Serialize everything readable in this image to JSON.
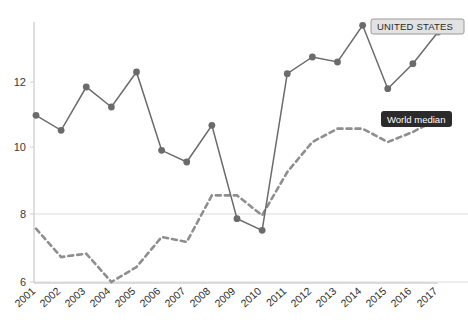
{
  "chart_data": {
    "type": "line",
    "title": "",
    "subtitle": "",
    "xlabel": "",
    "ylabel": "",
    "x": [
      2001,
      2002,
      2003,
      2004,
      2005,
      2006,
      2007,
      2008,
      2009,
      2010,
      2011,
      2012,
      2013,
      2014,
      2015,
      2016,
      2017
    ],
    "xticklabels": [
      "2001",
      "2002",
      "2003",
      "2004",
      "2005",
      "2006",
      "2007",
      "2008",
      "2009",
      "2010",
      "2011",
      "2012",
      "2013",
      "2014",
      "2015",
      "2016",
      "2017"
    ],
    "yticks": [
      6,
      8,
      10,
      12
    ],
    "yticklabels": [
      "6",
      "8",
      "10",
      "12"
    ],
    "ylim": [
      5.6,
      14.3
    ],
    "xlim": [
      2000.6,
      2017.4
    ],
    "grid": "horizontal-light",
    "legend_position": "inline-annotations",
    "series": [
      {
        "name": "UNITED STATES",
        "style": "solid-with-markers",
        "color": "#6b6b6b",
        "values": [
          11.0,
          10.55,
          11.85,
          11.25,
          12.3,
          9.95,
          9.6,
          10.7,
          7.9,
          7.55,
          12.25,
          12.75,
          12.6,
          13.7,
          11.8,
          12.55,
          13.5
        ]
      },
      {
        "name": "World median",
        "style": "dashed",
        "color": "#8e8e8e",
        "values": [
          7.6,
          6.75,
          6.85,
          6.0,
          6.45,
          7.35,
          7.2,
          8.6,
          8.6,
          8.0,
          9.3,
          10.2,
          10.6,
          10.6,
          10.2,
          10.5,
          10.9
        ]
      }
    ],
    "annotations": [
      {
        "id": "us-label",
        "text": "UNITED STATES",
        "style": "light-box"
      },
      {
        "id": "world-label",
        "text": "World median",
        "style": "dark-tooltip"
      }
    ]
  },
  "axis": {
    "y_axis_name": "value-axis",
    "x_axis_name": "year-axis"
  }
}
